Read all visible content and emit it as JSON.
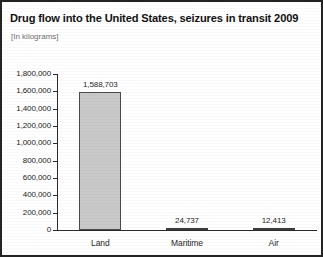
{
  "figure": {
    "title": "Drug flow into the United States, seizures in transit 2009",
    "subtitle": "[In kilograms]",
    "border_color": "#242424",
    "background": "#ffffff"
  },
  "chart_data": {
    "type": "bar",
    "title": "Drug flow into the United States, seizures in transit 2009",
    "subtitle": "[In kilograms]",
    "xlabel": "",
    "ylabel": "",
    "categories": [
      "Land",
      "Maritime",
      "Air"
    ],
    "values": [
      1588703,
      24737,
      12413
    ],
    "value_labels": [
      "1,588,703",
      "24,737",
      "12,413"
    ],
    "ylim": [
      0,
      1800000
    ],
    "ytick_values": [
      0,
      200000,
      400000,
      600000,
      800000,
      1000000,
      1200000,
      1400000,
      1600000,
      1800000
    ],
    "ytick_labels": [
      "0",
      "200,000",
      "400,000",
      "600,000",
      "800,000",
      "1,000,000",
      "1,200,000",
      "1,400,000",
      "1,600,000",
      "1,800,000"
    ],
    "grid": false,
    "legend": null,
    "bar_fill": "#c9c9c9",
    "bar_edge": "#4a4a4a",
    "small_bar_fill": "#777777",
    "axis_color": "#2b2b2b"
  }
}
